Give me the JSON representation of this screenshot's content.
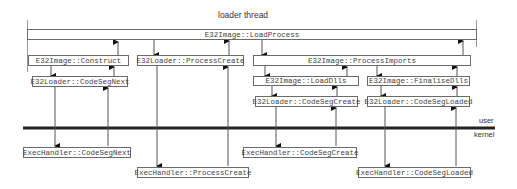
{
  "title": "loader thread",
  "boundary": {
    "user": "user",
    "kernel": "kernel"
  },
  "boxes": {
    "load_process": "E32Image::LoadProcess",
    "construct": "E32Image::Construct",
    "codeseg_next_user": "E32Loader::CodeSegNext",
    "process_create_user": "E32Loader::ProcessCreate",
    "process_imports": "E32Image::ProcessImports",
    "load_dlls": "E32Image::LoadDlls",
    "finalise_dlls": "E32Image::FinaliseDlls",
    "codeseg_create_user": "E32Loader::CodeSegCreate",
    "codeseg_loaded_user": "E32Loader::CodeSegLoaded",
    "codeseg_next_kernel": "ExecHandler::CodeSegNext",
    "process_create_kernel": "ExecHandler::ProcessCreate",
    "codeseg_create_kernel": "ExecHandler::CodeSegCreate",
    "codeseg_loaded_kernel": "ExecHandler::CodeSegLoaded"
  }
}
